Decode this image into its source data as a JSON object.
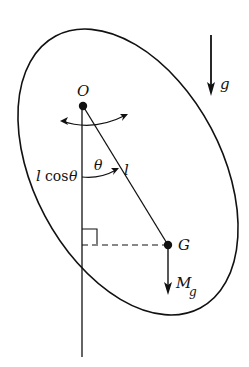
{
  "diagram": {
    "type": "compound-pendulum-free-body",
    "labels": {
      "pivot": "O",
      "center_of_mass": "G",
      "gravity": "g",
      "weight_M": "M",
      "weight_g": "g",
      "length": "l",
      "angle": "θ",
      "projection_l": "l",
      "projection_cos": "cos",
      "projection_theta": "θ"
    },
    "elements": [
      "rigid body outline (tilted ellipse)",
      "pivot point O",
      "center of mass G",
      "line OG of length l",
      "vertical reference line through O",
      "angle θ between vertical and OG",
      "horizontal dashed line from G to vertical with right-angle marker",
      "weight arrow Mg at G",
      "gravity direction arrow g",
      "curved double-headed oscillation arrow"
    ],
    "colors": {
      "stroke": "#111111",
      "background": "#ffffff"
    }
  }
}
